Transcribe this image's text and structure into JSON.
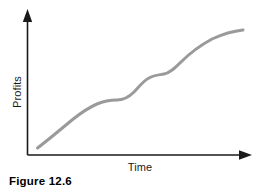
{
  "figure": {
    "caption": "Figure 12.6",
    "background_color": "#ffffff"
  },
  "chart_data": {
    "type": "line",
    "title": "",
    "xlabel": "Time",
    "ylabel": "Profits",
    "grid": false,
    "legend": null,
    "axis_style": {
      "x_axis_arrow": "right",
      "y_axis_arrow": "up",
      "axis_color": "#1a1a1a",
      "tick_labels_x": [],
      "tick_labels_y": []
    },
    "series": [
      {
        "name": "Profits over time",
        "color": "#9a9a9a",
        "line_width": 3,
        "description": "Steadily rising curve with two brief plateaus",
        "points": [
          {
            "x": 0.0,
            "y": 0.05
          },
          {
            "x": 0.08,
            "y": 0.13
          },
          {
            "x": 0.17,
            "y": 0.22
          },
          {
            "x": 0.26,
            "y": 0.32
          },
          {
            "x": 0.33,
            "y": 0.4
          },
          {
            "x": 0.38,
            "y": 0.45
          },
          {
            "x": 0.43,
            "y": 0.47
          },
          {
            "x": 0.5,
            "y": 0.48
          },
          {
            "x": 0.55,
            "y": 0.5
          },
          {
            "x": 0.6,
            "y": 0.55
          },
          {
            "x": 0.65,
            "y": 0.62
          },
          {
            "x": 0.68,
            "y": 0.65
          },
          {
            "x": 0.72,
            "y": 0.66
          },
          {
            "x": 0.77,
            "y": 0.7
          },
          {
            "x": 0.84,
            "y": 0.79
          },
          {
            "x": 0.92,
            "y": 0.89
          },
          {
            "x": 1.0,
            "y": 1.0
          }
        ],
        "path_d": "M 37.5 148 C 48 140, 60 130, 72 120 C 82 112, 90 107, 97 104 C 104 101, 110 100, 117 100 C 124 100, 129 97, 134 92 C 139 87, 143 81, 149 78 C 154 75, 159 75, 164 74 C 170 73, 175 68, 181 62 C 190 53, 201 45, 212 39 C 223 34, 234 31, 243 30"
      }
    ],
    "xlim": [
      0,
      1
    ],
    "ylim": [
      0,
      1
    ]
  }
}
